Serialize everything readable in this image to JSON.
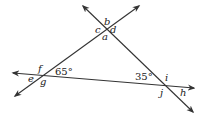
{
  "diagram": {
    "type": "three intersecting lines forming a triangle",
    "angle_labels": {
      "a": "a",
      "b": "b",
      "c": "c",
      "d": "d",
      "e": "e",
      "f": "f",
      "g": "g",
      "h": "h",
      "i": "i",
      "j": "j"
    },
    "given_angles": {
      "left": "65°",
      "right": "35°"
    },
    "line_color": "#333333"
  }
}
